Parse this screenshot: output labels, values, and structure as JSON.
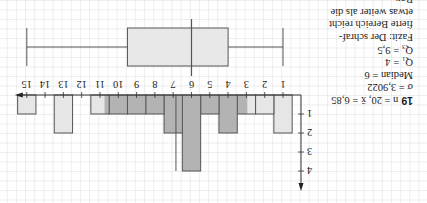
{
  "exercise": {
    "number": "19",
    "lines": [
      "n = 20, x̄ = 6,85",
      "σ = 3,9022",
      "Median = 6",
      "Q₁ = 4",
      "Q₃ = 9,5",
      "Fazit: Der schraf-",
      "fierte Bereich reicht",
      "etwas weiter als die",
      "Box."
    ]
  },
  "orientation": "rotated-180",
  "colors": {
    "bar_light": "#e6e6e6",
    "bar_dark": "#b3b3b3",
    "box_fill": "#e8e8e8",
    "line": "#555555",
    "grid": "#e3e3e3"
  },
  "chart_data": [
    {
      "type": "bar",
      "title": "",
      "xlabel": "",
      "ylabel": "",
      "categories": [
        "1",
        "2",
        "3",
        "4",
        "5",
        "6",
        "7",
        "8",
        "9",
        "10",
        "11",
        "12",
        "13",
        "14",
        "15"
      ],
      "values": [
        2,
        1,
        1,
        2,
        1,
        4,
        2,
        1,
        1,
        1,
        1,
        0,
        2,
        0,
        1
      ],
      "x_ticks": [
        "1",
        "2",
        "3",
        "4",
        "5",
        "6",
        "7",
        "8",
        "9",
        "10",
        "11",
        "12",
        "13",
        "14",
        "15"
      ],
      "y_ticks": [
        "1",
        "2",
        "3",
        "4"
      ],
      "ylim": [
        0,
        4
      ],
      "shaded_interval": {
        "from": 2.95,
        "to": 10.75,
        "label": "x̄ ± σ"
      },
      "mean_marker": 6.85,
      "grid": true
    },
    {
      "type": "boxplot",
      "min": 1,
      "q1": 4,
      "median": 6,
      "q3": 9.5,
      "max": 15
    }
  ]
}
